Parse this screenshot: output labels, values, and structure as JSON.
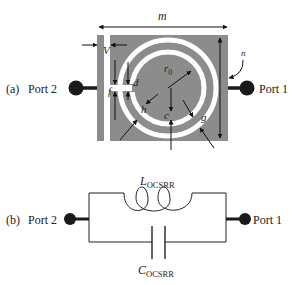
{
  "panel_a": {
    "label": "(a)",
    "port_left": "Port 2",
    "port_right": "Port 1",
    "dimensions": {
      "m": "m",
      "n": "n",
      "V": "V",
      "f": "f",
      "d": "d",
      "r0": "r",
      "r0_sub": "0",
      "h": "h",
      "c": "c",
      "g": "g"
    },
    "colors": {
      "metal": "#8c8c8c",
      "slot": "#ffffff",
      "port": "#1a1a1a",
      "line": "#111111"
    }
  },
  "panel_b": {
    "label": "(b)",
    "port_left": "Port 2",
    "port_right": "Port 1",
    "inductor_label": "L",
    "inductor_sub": "OCSRR",
    "capacitor_label": "C",
    "capacitor_sub": "OCSRR"
  }
}
